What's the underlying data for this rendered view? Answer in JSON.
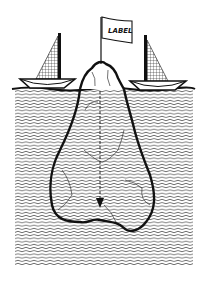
{
  "illustration": {
    "subject": "iceberg-metaphor",
    "flag": {
      "label": "LABEL"
    },
    "colors": {
      "ink": "#111111",
      "background": "#ffffff",
      "water_line": "#333333"
    },
    "elements": [
      "left-sailboat",
      "right-sailboat",
      "flag",
      "iceberg-tip",
      "iceberg-underwater",
      "water",
      "depth-arrow"
    ]
  }
}
